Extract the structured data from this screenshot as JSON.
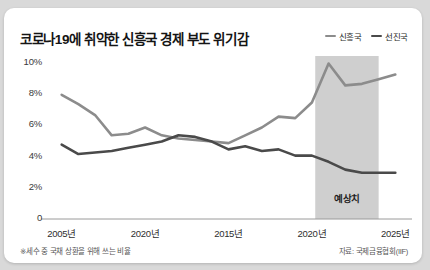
{
  "chart": {
    "title": "코로나19에 취약한 신흥국 경제 부도 위기감",
    "footnote": "※세수 중 국채 상환을 위해 쓰는 비율",
    "source": "자료: 국제금융협회(IIF)",
    "forecast_label": "예상치",
    "legend": [
      {
        "name": "신흥국",
        "color": "#8c8c8c"
      },
      {
        "name": "선진국",
        "color": "#4a4a4a"
      }
    ]
  },
  "chart_data": {
    "type": "line",
    "title": "코로나19에 취약한 신흥국 경제 부도 위기감",
    "xlabel": "",
    "ylabel": "",
    "ylim": [
      0,
      10
    ],
    "yticks": [
      0,
      2,
      4,
      6,
      8,
      10
    ],
    "ytick_labels": [
      "0",
      "2%",
      "4%",
      "6%",
      "8%",
      "10%"
    ],
    "xtick_labels": [
      "2005년",
      "2020년",
      "2015년",
      "2020년",
      "2025년"
    ],
    "xtick_positions": [
      2005,
      2010,
      2015,
      2020,
      2025
    ],
    "xlim": [
      2004,
      2026
    ],
    "grid": false,
    "legend_position": "top-right",
    "annotations": [
      {
        "text": "예상치",
        "type": "shaded-region",
        "x_start": 2020.2,
        "x_end": 2024.0
      }
    ],
    "series": [
      {
        "name": "신흥국",
        "color": "#8c8c8c",
        "x": [
          2005,
          2006,
          2007,
          2008,
          2009,
          2010,
          2011,
          2012,
          2013,
          2014,
          2015,
          2016,
          2017,
          2018,
          2019,
          2020,
          2021,
          2022,
          2023,
          2024,
          2025
        ],
        "values": [
          7.9,
          7.3,
          6.6,
          5.3,
          5.4,
          5.8,
          5.3,
          5.1,
          5.0,
          4.9,
          4.8,
          5.3,
          5.8,
          6.5,
          6.4,
          7.4,
          9.9,
          8.5,
          8.6,
          8.9,
          9.2
        ]
      },
      {
        "name": "선진국",
        "color": "#4a4a4a",
        "x": [
          2005,
          2006,
          2007,
          2008,
          2009,
          2010,
          2011,
          2012,
          2013,
          2014,
          2015,
          2016,
          2017,
          2018,
          2019,
          2020,
          2021,
          2022,
          2023,
          2024,
          2025
        ],
        "values": [
          4.7,
          4.1,
          4.2,
          4.3,
          4.5,
          4.7,
          4.9,
          5.3,
          5.2,
          4.9,
          4.4,
          4.6,
          4.3,
          4.4,
          4.0,
          4.0,
          3.6,
          3.1,
          2.9,
          2.9,
          2.9
        ]
      }
    ]
  }
}
